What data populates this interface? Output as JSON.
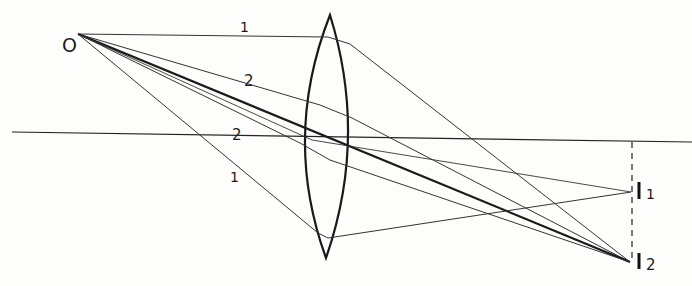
{
  "diagram": {
    "object_label": "O",
    "image_labels": [
      "I",
      "I"
    ],
    "image_subscripts": [
      "1",
      "2"
    ],
    "ray_labels": {
      "top_paraxial": "1",
      "top_marginal": "2",
      "axis_near": "2",
      "bottom_marginal": "1"
    },
    "colors": {
      "ink": "#1a1a1a",
      "background": "#fdfdfb"
    }
  }
}
